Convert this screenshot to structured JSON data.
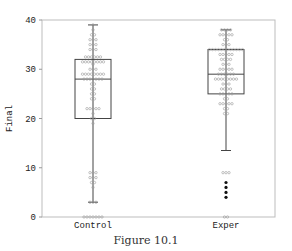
{
  "caption": "Figure 10.1",
  "chart_data": {
    "type": "box",
    "title": "",
    "xlabel": "",
    "ylabel": "Final",
    "ylim": [
      0,
      40
    ],
    "yticks": [
      0,
      10,
      20,
      30,
      40
    ],
    "grid": false,
    "categories": [
      "Control",
      "Exper"
    ],
    "boxes": [
      {
        "name": "Control",
        "whisker_low": 3,
        "q1": 20,
        "median": 28,
        "q3": 32,
        "whisker_high": 39,
        "points": [
          {
            "y": 39,
            "n": 1
          },
          {
            "y": 38,
            "n": 1
          },
          {
            "y": 37,
            "n": 2
          },
          {
            "y": 36,
            "n": 3
          },
          {
            "y": 35,
            "n": 3
          },
          {
            "y": 34,
            "n": 3
          },
          {
            "y": 32.5,
            "n": 6
          },
          {
            "y": 31.5,
            "n": 8
          },
          {
            "y": 31,
            "n": 1
          },
          {
            "y": 30,
            "n": 3
          },
          {
            "y": 29,
            "n": 8
          },
          {
            "y": 28,
            "n": 7
          },
          {
            "y": 27,
            "n": 2
          },
          {
            "y": 26,
            "n": 2
          },
          {
            "y": 25,
            "n": 2
          },
          {
            "y": 24,
            "n": 2
          },
          {
            "y": 22,
            "n": 5
          },
          {
            "y": 21,
            "n": 1
          },
          {
            "y": 20,
            "n": 2
          },
          {
            "y": 19,
            "n": 1
          },
          {
            "y": 9,
            "n": 3
          },
          {
            "y": 8,
            "n": 3
          },
          {
            "y": 7,
            "n": 2
          },
          {
            "y": 6,
            "n": 1
          },
          {
            "y": 3,
            "n": 3
          },
          {
            "y": 0,
            "n": 7
          }
        ],
        "outliers_filled": []
      },
      {
        "name": "Exper",
        "whisker_low": 13.5,
        "q1": 25,
        "median": 29,
        "q3": 34,
        "whisker_high": 38,
        "points": [
          {
            "y": 38,
            "n": 4
          },
          {
            "y": 37,
            "n": 5
          },
          {
            "y": 36,
            "n": 2
          },
          {
            "y": 35,
            "n": 3
          },
          {
            "y": 34,
            "n": 12
          },
          {
            "y": 33,
            "n": 5
          },
          {
            "y": 32,
            "n": 4
          },
          {
            "y": 31,
            "n": 3
          },
          {
            "y": 30,
            "n": 5
          },
          {
            "y": 29,
            "n": 6
          },
          {
            "y": 28,
            "n": 8
          },
          {
            "y": 27,
            "n": 3
          },
          {
            "y": 26,
            "n": 4
          },
          {
            "y": 25,
            "n": 5
          },
          {
            "y": 24,
            "n": 2
          },
          {
            "y": 23,
            "n": 5
          },
          {
            "y": 22,
            "n": 2
          },
          {
            "y": 21,
            "n": 2
          },
          {
            "y": 9,
            "n": 3
          },
          {
            "y": 0,
            "n": 2
          }
        ],
        "outliers_filled": [
          7,
          6,
          5,
          4
        ]
      }
    ]
  }
}
